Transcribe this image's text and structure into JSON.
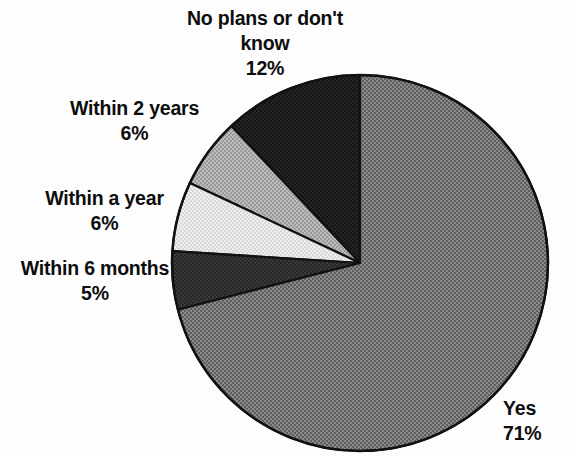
{
  "chart_data": {
    "type": "pie",
    "title": "",
    "subtitle": "",
    "xlabel": "",
    "ylabel": "",
    "legend_position": "none",
    "grid": false,
    "units": "percent",
    "start_angle_deg": 90,
    "direction": "counterclockwise",
    "center": {
      "x": 360,
      "y": 263
    },
    "radius": 188,
    "categories": [
      "No plans or don't know",
      "Within 2 years",
      "Within a year",
      "Within 6 months",
      "Yes"
    ],
    "values": [
      12,
      6,
      6,
      5,
      71
    ],
    "slices": [
      {
        "label": "No plans or don't know",
        "value": 12,
        "value_text": "12%",
        "color": "#181818",
        "texture": "dark-dither"
      },
      {
        "label": "Within 2 years",
        "value": 6,
        "value_text": "6%",
        "color": "#a9a9a9",
        "texture": "medium-dither"
      },
      {
        "label": "Within a year",
        "value": 6,
        "value_text": "6%",
        "color": "#e0e0e0",
        "texture": "light-dither"
      },
      {
        "label": "Within 6 months",
        "value": 5,
        "value_text": "5%",
        "color": "#2e2e2e",
        "texture": "dark-dither"
      },
      {
        "label": "Yes",
        "value": 71,
        "value_text": "71%",
        "color": "#737373",
        "texture": "mid-dither"
      }
    ]
  },
  "labels": {
    "no_plans": {
      "text": "No plans or don't\nknow\n12%",
      "left": 160,
      "top": 6,
      "width": 210
    },
    "within_2_years": {
      "text": "Within 2 years\n6%",
      "left": 37,
      "top": 96,
      "width": 195
    },
    "within_a_year": {
      "text": "Within a year\n6%",
      "left": 12,
      "top": 186,
      "width": 185
    },
    "within_6_months": {
      "text": "Within 6 months\n5%",
      "left": 0,
      "top": 256,
      "width": 190
    },
    "yes": {
      "text": "Yes\n71%",
      "left": 503,
      "top": 396,
      "width": 70
    }
  },
  "colors": {
    "background": "#fdfdfd",
    "outline": "#111111",
    "text": "#0d0d0d"
  }
}
